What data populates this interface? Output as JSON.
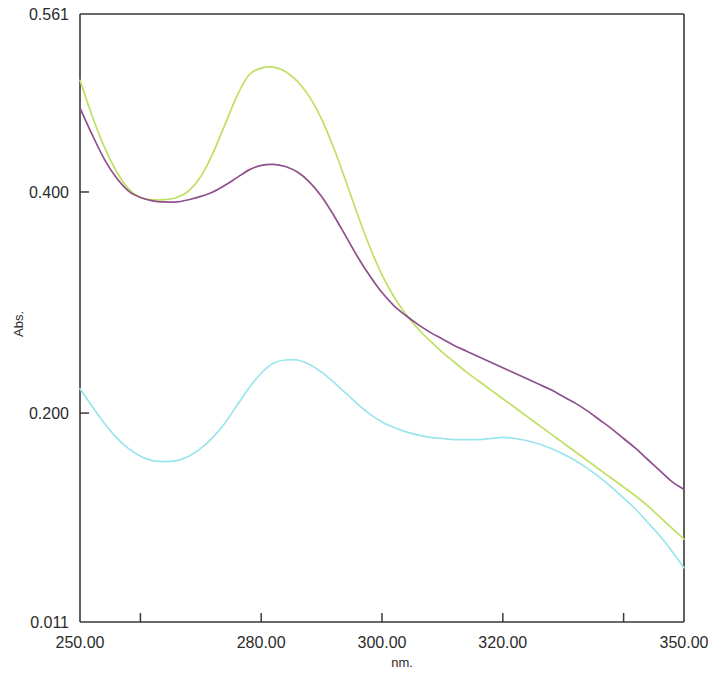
{
  "chart_data": {
    "type": "line",
    "title": "",
    "xlabel": "nm.",
    "ylabel": "Abs.",
    "xlim": [
      250.0,
      350.0
    ],
    "ylim": [
      0.011,
      0.561
    ],
    "grid": false,
    "legend": "none",
    "x_tick_labels": [
      "250.00",
      "280.00",
      "300.00",
      "320.00",
      "350.00"
    ],
    "x_tick_values": [
      250.0,
      280.0,
      300.0,
      320.0,
      350.0
    ],
    "x_minor_tick_values": [
      260.0,
      340.0
    ],
    "y_tick_labels": [
      "0.561",
      "0.400",
      "0.200",
      "0.011"
    ],
    "y_tick_values": [
      0.561,
      0.4,
      0.2,
      0.011
    ],
    "x": [
      250,
      252,
      254,
      256,
      258,
      260,
      262,
      264,
      266,
      268,
      270,
      272,
      274,
      276,
      278,
      280,
      282,
      284,
      286,
      288,
      290,
      292,
      294,
      296,
      298,
      300,
      302,
      304,
      306,
      308,
      310,
      312,
      314,
      316,
      318,
      320,
      322,
      324,
      326,
      328,
      330,
      332,
      334,
      336,
      338,
      340,
      342,
      344,
      346,
      348,
      350
    ],
    "series": [
      {
        "name": "green-trace",
        "color": "#bfe063",
        "values": [
          0.501,
          0.469,
          0.441,
          0.419,
          0.403,
          0.395,
          0.393,
          0.393,
          0.395,
          0.401,
          0.414,
          0.435,
          0.461,
          0.487,
          0.506,
          0.512,
          0.513,
          0.509,
          0.5,
          0.486,
          0.466,
          0.44,
          0.41,
          0.379,
          0.35,
          0.325,
          0.305,
          0.289,
          0.276,
          0.265,
          0.255,
          0.246,
          0.237,
          0.229,
          0.221,
          0.213,
          0.205,
          0.197,
          0.189,
          0.181,
          0.173,
          0.165,
          0.157,
          0.149,
          0.141,
          0.133,
          0.125,
          0.116,
          0.106,
          0.096,
          0.086
        ]
      },
      {
        "name": "purple-trace",
        "color": "#8f4f8c",
        "values": [
          0.476,
          0.452,
          0.43,
          0.413,
          0.401,
          0.395,
          0.392,
          0.391,
          0.391,
          0.393,
          0.396,
          0.4,
          0.406,
          0.413,
          0.42,
          0.424,
          0.425,
          0.423,
          0.418,
          0.409,
          0.396,
          0.379,
          0.36,
          0.341,
          0.324,
          0.309,
          0.297,
          0.288,
          0.28,
          0.273,
          0.267,
          0.261,
          0.256,
          0.251,
          0.246,
          0.241,
          0.236,
          0.231,
          0.226,
          0.221,
          0.215,
          0.209,
          0.202,
          0.194,
          0.186,
          0.177,
          0.168,
          0.158,
          0.148,
          0.138,
          0.131
        ]
      },
      {
        "name": "cyan-trace",
        "color": "#9ae5ec",
        "values": [
          0.222,
          0.206,
          0.191,
          0.178,
          0.168,
          0.161,
          0.157,
          0.156,
          0.157,
          0.161,
          0.168,
          0.178,
          0.191,
          0.207,
          0.223,
          0.236,
          0.245,
          0.248,
          0.248,
          0.244,
          0.237,
          0.228,
          0.218,
          0.208,
          0.199,
          0.192,
          0.187,
          0.183,
          0.18,
          0.178,
          0.177,
          0.176,
          0.176,
          0.176,
          0.177,
          0.178,
          0.177,
          0.175,
          0.172,
          0.168,
          0.163,
          0.157,
          0.15,
          0.142,
          0.133,
          0.123,
          0.113,
          0.101,
          0.089,
          0.075,
          0.06
        ]
      }
    ]
  },
  "axes": {
    "y_label": "Abs.",
    "x_label": "nm."
  }
}
